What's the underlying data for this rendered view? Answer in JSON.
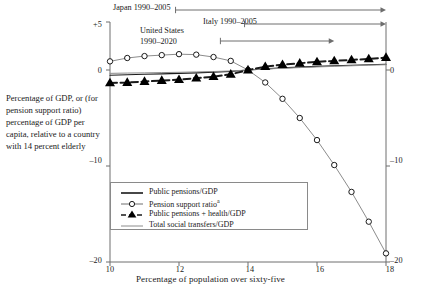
{
  "chart_data": {
    "type": "line",
    "title": "",
    "xlabel": "Percentage of population over sixty-five",
    "ylabel": "Percentage of GDP, or (for pension support ratio) percentage of GDP per capita, relative to a country with 14 percent elderly",
    "xlim": [
      10,
      18
    ],
    "ylim": [
      -20,
      5
    ],
    "xticks": [
      10,
      12,
      14,
      16,
      18
    ],
    "yticks_left": [
      "+5",
      "0",
      "–10",
      "–20"
    ],
    "yticks_left_values": [
      5,
      0,
      -10,
      -20
    ],
    "yticks_right": [
      "0",
      "–10",
      "–20"
    ],
    "yticks_right_values": [
      0,
      -10,
      -20
    ],
    "grid": false,
    "legend_position": "inside-lower-left",
    "series": [
      {
        "name": "Public pensions/GDP",
        "marker": "none",
        "style": "solid-thin",
        "x": [
          10.0,
          10.5,
          11.0,
          11.5,
          12.0,
          12.5,
          13.0,
          13.5,
          14.0,
          14.5,
          15.0,
          15.5,
          16.0,
          16.5,
          17.0,
          17.5,
          18.0
        ],
        "values": [
          -0.55,
          -0.5,
          -0.45,
          -0.4,
          -0.35,
          -0.3,
          -0.22,
          -0.14,
          0.0,
          0.12,
          0.22,
          0.3,
          0.38,
          0.44,
          0.5,
          0.55,
          0.6
        ]
      },
      {
        "name": "Pension support ratio",
        "name_sup": "a",
        "marker": "open-circle",
        "style": "solid-thin",
        "x": [
          10.0,
          10.5,
          11.0,
          11.5,
          12.0,
          12.5,
          13.0,
          13.5,
          14.0,
          14.5,
          15.0,
          15.5,
          16.0,
          16.5,
          17.0,
          17.5,
          18.0
        ],
        "values": [
          0.9,
          1.25,
          1.45,
          1.55,
          1.65,
          1.6,
          1.35,
          0.95,
          0.0,
          -1.3,
          -3.0,
          -5.0,
          -7.3,
          -9.9,
          -12.7,
          -15.8,
          -19.1
        ]
      },
      {
        "name": "Public pensions + health/GDP",
        "marker": "filled-triangle",
        "style": "dashed-thick",
        "x": [
          10.0,
          10.5,
          11.0,
          11.5,
          12.0,
          12.5,
          13.0,
          13.5,
          14.0,
          14.5,
          15.0,
          15.5,
          16.0,
          16.5,
          17.0,
          17.5,
          18.0
        ],
        "values": [
          -1.35,
          -1.3,
          -1.2,
          -1.1,
          -1.0,
          -0.85,
          -0.7,
          -0.45,
          0.0,
          0.35,
          0.55,
          0.7,
          0.85,
          0.95,
          1.05,
          1.15,
          1.3
        ]
      },
      {
        "name": "Total social transfers/GDP",
        "marker": "none",
        "style": "solid-thin",
        "x": [
          10.0,
          10.5,
          11.0,
          11.5,
          12.0,
          12.5,
          13.0,
          13.5,
          14.0,
          14.5,
          15.0,
          15.5,
          16.0,
          16.5,
          17.0,
          17.5,
          18.0
        ],
        "values": [
          -0.35,
          -0.32,
          -0.3,
          -0.27,
          -0.24,
          -0.2,
          -0.16,
          -0.1,
          0.0,
          0.1,
          0.18,
          0.25,
          0.32,
          0.38,
          0.44,
          0.5,
          0.55
        ]
      }
    ],
    "annotations": [
      {
        "label": "Japan 1990–2005",
        "x_start": 11.9,
        "x_end": 18.0,
        "row": 0
      },
      {
        "label": "Italy 1990–2005",
        "x_start": 13.9,
        "x_end": 18.0,
        "row": 1
      },
      {
        "label": "United States 1990–2020",
        "label_line1": "United States",
        "label_line2": "1990–2020",
        "x_start": 13.2,
        "x_end": 16.5,
        "row": 2
      }
    ]
  },
  "axis": {
    "xlabel": "Percentage of population over sixty-five",
    "ylabel": "Percentage of GDP, or (for pension support ratio) percentage of GDP per capita, relative to a country with 14 percent elderly",
    "xtick_10": "10",
    "xtick_12": "12",
    "xtick_14": "14",
    "xtick_16": "16",
    "xtick_18": "18",
    "ytick_p5": "+5",
    "ytick_0": "0",
    "ytick_m10": "–10",
    "ytick_m20": "–20",
    "ytick_r0": "0",
    "ytick_rm10": "–10",
    "ytick_rm20": "–20"
  },
  "legend": {
    "items": [
      {
        "label": "Public pensions/GDP",
        "sup": ""
      },
      {
        "label": "Pension support ratio",
        "sup": "a"
      },
      {
        "label": "Public pensions + health/GDP",
        "sup": ""
      },
      {
        "label": "Total social transfers/GDP",
        "sup": ""
      }
    ]
  },
  "annotations": {
    "japan": "Japan 1990–2005",
    "italy": "Italy 1990–2005",
    "us_line1": "United States",
    "us_line2": "1990–2020"
  },
  "colors": {
    "ink": "#1a1a1a",
    "axis": "#6e6e6e",
    "series_line": "#8c8c8c",
    "marker_fill": "#000000",
    "background": "#ffffff"
  }
}
